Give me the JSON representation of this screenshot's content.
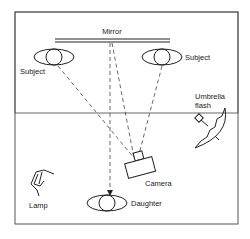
{
  "diagram": {
    "type": "photography-setup",
    "labels": {
      "mirror": "Mirror",
      "subject_left": "Subject",
      "subject_right": "Subject",
      "umbrella_line1": "Umbrella",
      "umbrella_line2": "flash",
      "camera": "Camera",
      "lamp": "Lamp",
      "daughter": "Daughter"
    },
    "colors": {
      "stroke": "#222222",
      "frame": "#555555",
      "background": "#ffffff"
    }
  }
}
